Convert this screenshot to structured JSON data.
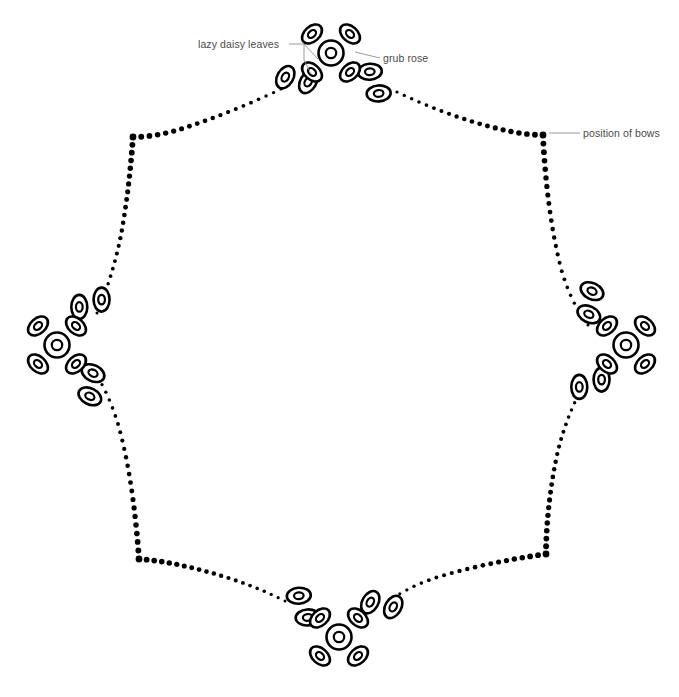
{
  "document": {
    "title": "Embroidery pattern outline",
    "background_color": "#ffffff",
    "width": 679,
    "height": 697
  },
  "annotations": [
    {
      "id": "lazy-daisy-leaves",
      "label": "lazy daisy leaves",
      "text_x": 198,
      "text_y": 48,
      "text_anchor": "start",
      "leader": "M 289,44 L 304,44 L 318,59 M 304,44 L 304,60 L 311,74"
    },
    {
      "id": "grub-rose",
      "label": "grub rose",
      "text_x": 383,
      "text_y": 62,
      "text_anchor": "start",
      "leader": "M 380,58 L 355,52"
    },
    {
      "id": "position-of-bows",
      "label": "position of bows",
      "text_x": 583,
      "text_y": 137,
      "text_anchor": "start",
      "leader": "M 580,133 L 549,133"
    }
  ],
  "outline": {
    "style": "dotted",
    "dot_color": "#000000",
    "description": "Scalloped eight-lobed border of stitch dots",
    "bow_vertices": [
      {
        "name": "upper-left",
        "x": 133,
        "y": 137
      },
      {
        "name": "upper-right",
        "x": 543,
        "y": 135
      },
      {
        "name": "lower-right",
        "x": 546,
        "y": 554
      },
      {
        "name": "lower-left",
        "x": 139,
        "y": 559
      }
    ],
    "segments": [
      {
        "name": "top-left-scallop",
        "from": "top-flower",
        "to": "upper-left-vertex",
        "path": "M 281,89 C 248,105 205,122 174,131 C 160,135 145,137 133,137",
        "dot_count": 20,
        "start_radius": 1.6,
        "end_radius": 3.0
      },
      {
        "name": "top-right-scallop",
        "from": "top-flower",
        "to": "upper-right-vertex",
        "path": "M 397,92 C 428,107 468,122 500,129 C 515,133 532,135 543,135",
        "dot_count": 20,
        "start_radius": 1.6,
        "end_radius": 3.0
      },
      {
        "name": "right-upper-scallop",
        "from": "upper-right-vertex",
        "to": "right-flower",
        "path": "M 543,135 C 545,180 551,232 562,272 C 569,295 578,312 588,325",
        "dot_count": 24,
        "start_radius": 3.0,
        "end_radius": 1.5
      },
      {
        "name": "right-lower-scallop",
        "from": "right-flower",
        "to": "lower-right-vertex",
        "path": "M 585,382 C 573,404 562,430 556,460 C 549,494 546,530 546,554",
        "dot_count": 24,
        "start_radius": 1.5,
        "end_radius": 3.0
      },
      {
        "name": "bottom-right-scallop",
        "from": "lower-right-vertex",
        "to": "bottom-flower",
        "path": "M 546,554 C 510,559 466,568 435,578 C 417,584 404,591 393,598",
        "dot_count": 21,
        "start_radius": 3.0,
        "end_radius": 1.5
      },
      {
        "name": "bottom-left-scallop",
        "from": "bottom-flower",
        "to": "lower-left-vertex",
        "path": "M 285,601 C 263,590 238,580 208,572 C 180,564 155,560 139,559",
        "dot_count": 21,
        "start_radius": 1.5,
        "end_radius": 3.0
      },
      {
        "name": "left-lower-scallop",
        "from": "lower-left-vertex",
        "to": "left-flower",
        "path": "M 139,559 C 136,517 130,466 118,424 C 110,398 101,381 93,370",
        "dot_count": 24,
        "start_radius": 3.0,
        "end_radius": 1.5
      },
      {
        "name": "left-upper-scallop",
        "from": "left-flower",
        "to": "upper-left-vertex",
        "path": "M 97,313 C 106,292 114,268 120,240 C 127,205 131,165 133,137",
        "dot_count": 24,
        "start_radius": 1.5,
        "end_radius": 3.0
      }
    ]
  },
  "motifs": {
    "grub_rose_label": "grub rose",
    "lazy_daisy_label": "lazy daisy leaves",
    "clusters": [
      {
        "name": "top-cluster",
        "rose": {
          "cx": 331,
          "cy": 53,
          "rotation": 0
        },
        "leaf_pairs": [
          {
            "cx": 297,
            "cy": 80,
            "rotation": -28
          },
          {
            "cx": 374,
            "cy": 83,
            "rotation": 28
          }
        ]
      },
      {
        "name": "right-cluster",
        "rose": {
          "cx": 626,
          "cy": 345,
          "rotation": 0
        },
        "leaf_pairs": [
          {
            "cx": 590,
            "cy": 303,
            "rotation": 58
          },
          {
            "cx": 590,
            "cy": 383,
            "rotation": 122
          }
        ]
      },
      {
        "name": "bottom-cluster",
        "rose": {
          "cx": 339,
          "cy": 637,
          "rotation": 0
        },
        "leaf_pairs": [
          {
            "cx": 303,
            "cy": 607,
            "rotation": 28
          },
          {
            "cx": 382,
            "cy": 605,
            "rotation": -28
          }
        ]
      },
      {
        "name": "left-cluster",
        "rose": {
          "cx": 57,
          "cy": 345,
          "rotation": 0
        },
        "leaf_pairs": [
          {
            "cx": 90,
            "cy": 303,
            "rotation": 122
          },
          {
            "cx": 91,
            "cy": 385,
            "rotation": 58
          }
        ]
      }
    ]
  }
}
